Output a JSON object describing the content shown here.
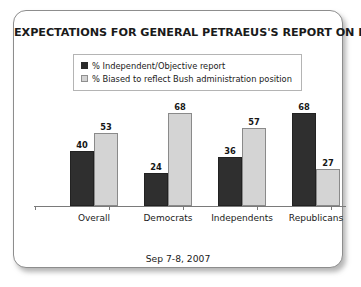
{
  "card": {
    "title": "EXPECTATIONS FOR GENERAL PETRAEUS'S REPORT ON IRAQ",
    "date_note": "Sep 7-8, 2007"
  },
  "legend": {
    "items": [
      {
        "label": "% Independent/Objective report",
        "swatch": "dark-swatch-icon",
        "color": "#2b2b2b"
      },
      {
        "label": "% Biased to reflect Bush administration position",
        "swatch": "light-swatch-icon",
        "color": "#d2d2d2"
      }
    ]
  },
  "chart_data": {
    "type": "bar",
    "title": "EXPECTATIONS FOR GENERAL PETRAEUS'S REPORT ON IRAQ",
    "subtitle": "Sep 7-8, 2007",
    "xlabel": "",
    "ylabel": "",
    "ylim": [
      0,
      80
    ],
    "grid": false,
    "legend_position": "top-center",
    "categories": [
      "Overall",
      "Democrats",
      "Independents",
      "Republicans"
    ],
    "series": [
      {
        "name": "% Independent/Objective report",
        "color": "#2f2f2f",
        "values": [
          40,
          24,
          36,
          68
        ]
      },
      {
        "name": "% Biased to reflect Bush administration position",
        "color": "#d4d4d4",
        "values": [
          53,
          68,
          57,
          27
        ]
      }
    ]
  }
}
